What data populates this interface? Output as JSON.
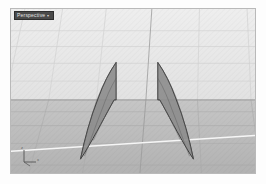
{
  "app": {
    "kind": "3d-modeling-viewport",
    "background_color": "#ffffff"
  },
  "viewport": {
    "label": "Perspective",
    "label_chevron": "▾",
    "label_bg": "#4a4a4a",
    "label_fg": "#e6e6e6",
    "frame_border_color": "#b9b9b9",
    "sky_color": "#e9e9e9",
    "ground_color": "#bcbcbc",
    "grid_minor_color": "#d2d2d2",
    "grid_major_color": "#a6a6a6",
    "horizon_color": "#8e8e8e",
    "ground_grid_color": "#ababab",
    "x_axis_color": "#f4f4f4",
    "y_axis_color": "#9a9a9a",
    "horizon_y": 92
  },
  "axis_gizmo": {
    "name": "world-axis-indicator",
    "x_label": "x",
    "y_label": "y",
    "z_label": "z",
    "color": "#5d5d5d"
  },
  "objects": [
    {
      "name": "sail-surface-left",
      "fill": "#8c8c8c",
      "fill_opacity": 0.92,
      "edge_color": "#3a3a3a",
      "isoparm_color": "#5e5e5e",
      "selected": false,
      "outline": "M 106,54 L 106,92 L 104,92 C 96,106 86,126 74,146 L 70,152 C 74,132 80,110 88,90 C 93,76 99,64 106,54 Z",
      "isoparms": [
        "M 106,54 C 98,66 92,78 87,91 C 80,110 75,131 70,152",
        "M 106,70 C 100,80 96,90 92,101 C 86,116 80,134 74,149",
        "M 104,92 C 97,104 90,118 83,133"
      ]
    },
    {
      "name": "sail-surface-right",
      "fill": "#8c8c8c",
      "fill_opacity": 0.92,
      "edge_color": "#3a3a3a",
      "isoparm_color": "#5e5e5e",
      "selected": false,
      "outline": "M 148,54 L 148,92 L 150,92 C 158,106 168,126 180,146 L 184,152 C 180,132 174,110 166,90 C 161,76 155,64 148,54 Z",
      "isoparms": [
        "M 148,54 C 156,66 162,78 167,91 C 174,110 179,131 184,152",
        "M 148,70 C 154,80 158,90 162,101 C 168,116 174,134 180,149",
        "M 150,92 C 157,104 164,118 171,133"
      ]
    }
  ],
  "grid": {
    "sky_horizontals": [
      22,
      38,
      55,
      73,
      92
    ],
    "sky_verticals_top_x": [
      14,
      52,
      96,
      142,
      190,
      238
    ],
    "sky_verticals_bottom_x": [
      -6,
      38,
      86,
      136,
      188,
      242
    ],
    "ground_horizontals": [
      92,
      104,
      118,
      136,
      158
    ],
    "ground_verticals_top_x": [
      -6,
      38,
      86,
      136,
      188,
      242
    ],
    "ground_verticals_bottom_x": [
      -52,
      18,
      72,
      130,
      192,
      252
    ],
    "major_vertical_index": 3,
    "x_axis_line": {
      "x1": 0,
      "y1": 144,
      "x2": 246,
      "y2": 128
    }
  }
}
